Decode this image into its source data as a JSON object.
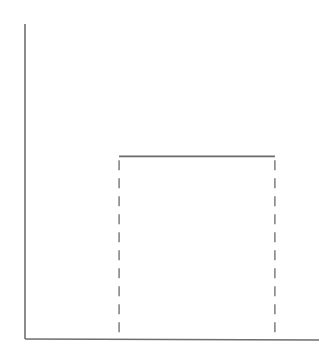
{
  "chart_data": {
    "type": "line",
    "title": "",
    "xlabel": "",
    "ylabel": "",
    "xlim": [
      0,
      1
    ],
    "ylim": [
      0,
      1
    ],
    "grid": false,
    "legend": null,
    "series": [
      {
        "name": "rectangular-pulse",
        "style": "solid",
        "x": [
          0.32,
          0.85
        ],
        "y": [
          0.58,
          0.58
        ]
      }
    ],
    "vertical_guides": [
      {
        "name": "left-edge",
        "x": 0.32,
        "y_from": 0,
        "y_to": 0.58,
        "style": "dashed"
      },
      {
        "name": "right-edge",
        "x": 0.85,
        "y_from": 0,
        "y_to": 0.58,
        "style": "dashed"
      }
    ],
    "x_ticks": [],
    "y_ticks": []
  },
  "colors": {
    "axis": "#6e6e6e",
    "line": "#6a6a6a",
    "background": "#ffffff"
  }
}
